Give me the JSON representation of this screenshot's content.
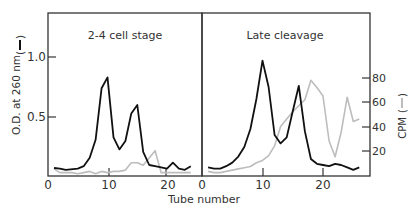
{
  "figure": {
    "x_axis_label": "Tube number",
    "left_y_axis_label": "O.D. at 260 nm",
    "right_y_axis_label": "CPM",
    "left_y_ticks": [
      "0.5",
      "1.0"
    ],
    "right_y_ticks": [
      "20",
      "40",
      "60",
      "80"
    ],
    "x_ticks": [
      "0",
      "10",
      "20"
    ],
    "colors": {
      "od_line": "#111111",
      "cpm_line": "#bdbdbd",
      "frame": "#333333",
      "text": "#333333"
    }
  },
  "chart_data": [
    {
      "type": "line",
      "title": "2-4 cell stage",
      "xlabel": "Tube number",
      "ylabel": "O.D. at 260 nm",
      "y2label": "CPM",
      "xlim": [
        0,
        25
      ],
      "ylim": [
        0,
        1.35
      ],
      "y2lim": [
        0,
        105
      ],
      "series": [
        {
          "name": "O.D. at 260 nm",
          "axis": "left",
          "x": [
            1,
            2,
            3,
            5,
            6,
            7,
            8,
            9,
            10,
            11,
            12,
            13,
            14,
            15,
            16,
            17,
            18,
            19,
            20,
            21,
            22,
            23,
            24
          ],
          "values": [
            0.075,
            0.07,
            0.06,
            0.07,
            0.09,
            0.16,
            0.31,
            0.74,
            0.83,
            0.33,
            0.23,
            0.3,
            0.53,
            0.6,
            0.21,
            0.1,
            0.09,
            0.08,
            0.07,
            0.12,
            0.07,
            0.06,
            0.09
          ]
        },
        {
          "name": "CPM",
          "axis": "right",
          "x": [
            1,
            2,
            3,
            4,
            5,
            6,
            7,
            8,
            9,
            10,
            11,
            12,
            13,
            14,
            15,
            16,
            17,
            18,
            19,
            20,
            21,
            22,
            23,
            24
          ],
          "values": [
            5,
            2,
            2,
            2,
            1,
            2,
            3,
            1,
            3,
            2,
            3,
            3,
            4,
            10,
            10,
            8,
            14,
            20,
            2,
            2,
            2,
            2,
            2,
            2
          ]
        }
      ]
    },
    {
      "type": "line",
      "title": "Late cleavage",
      "xlabel": "Tube number",
      "ylabel": "O.D. at 260 nm",
      "y2label": "CPM",
      "xlim": [
        0,
        28
      ],
      "ylim": [
        0,
        1.35
      ],
      "y2lim": [
        0,
        105
      ],
      "series": [
        {
          "name": "O.D. at 260 nm",
          "axis": "left",
          "x": [
            1,
            2,
            3,
            4,
            5,
            6,
            7,
            8,
            9,
            10,
            11,
            12,
            13,
            14,
            15,
            16,
            17,
            18,
            19,
            20,
            21,
            22,
            23,
            24,
            25,
            26
          ],
          "values": [
            0.08,
            0.07,
            0.07,
            0.09,
            0.12,
            0.17,
            0.25,
            0.4,
            0.65,
            0.97,
            0.75,
            0.35,
            0.28,
            0.33,
            0.55,
            0.76,
            0.38,
            0.15,
            0.11,
            0.1,
            0.09,
            0.11,
            0.1,
            0.08,
            0.06,
            0.08
          ]
        },
        {
          "name": "CPM",
          "axis": "right",
          "x": [
            1,
            2,
            3,
            4,
            5,
            6,
            7,
            8,
            9,
            10,
            11,
            12,
            13,
            14,
            15,
            16,
            17,
            18,
            19,
            20,
            21,
            22,
            23,
            24,
            25,
            26
          ],
          "values": [
            3,
            2,
            2,
            3,
            4,
            5,
            6,
            7,
            10,
            12,
            16,
            24,
            40,
            46,
            52,
            57,
            62,
            78,
            72,
            65,
            28,
            15,
            35,
            64,
            44,
            46
          ]
        }
      ]
    }
  ]
}
